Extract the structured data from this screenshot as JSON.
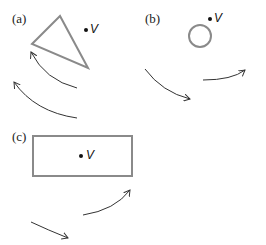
{
  "figure": {
    "panels": [
      {
        "id": "a",
        "label": "(a)",
        "shape": "triangle",
        "point_label": "V",
        "arrows": 2,
        "arrow_direction": "counterclockwise"
      },
      {
        "id": "b",
        "label": "(b)",
        "shape": "circle",
        "point_label": "V",
        "arrows": 2,
        "arrow_direction": "clockwise"
      },
      {
        "id": "c",
        "label": "(c)",
        "shape": "rectangle",
        "point_label": "V",
        "arrows": 2,
        "arrow_direction": "counterclockwise"
      }
    ],
    "colors": {
      "shape_stroke": "#8a8a8a",
      "arrow_stroke": "#333333",
      "point": "#111111"
    }
  }
}
